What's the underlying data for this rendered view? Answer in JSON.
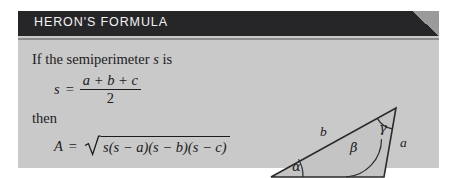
{
  "header": {
    "title": "HERON'S FORMULA",
    "bar_color": "#262628",
    "title_color": "#f2f2f2",
    "corner_color": "#9a9a9a"
  },
  "panel": {
    "background_color": "#c9c9c9",
    "rule_color": "#8d8d8d"
  },
  "body": {
    "intro_prefix": "If the semiperimeter ",
    "intro_variable": "s",
    "intro_suffix": " is",
    "then_label": "then"
  },
  "equation_s": {
    "lhs": "s",
    "equals": "=",
    "numerator": "a + b + c",
    "denominator": "2"
  },
  "equation_area": {
    "lhs": "A",
    "equals": "=",
    "radical_symbol": "√",
    "radicand": "s(s − a)(s − b)(s − c)"
  },
  "figure": {
    "caption_name": "labelled-triangle",
    "side_labels": {
      "a": "a",
      "b": "b",
      "c": "c"
    },
    "angle_labels": {
      "alpha": "α",
      "beta": "β",
      "gamma": "γ"
    },
    "fill_color": "#c4c4c4",
    "stroke_color": "#2b2b2b",
    "vertices": {
      "left": [
        21,
        89
      ],
      "apex": [
        146,
        20
      ],
      "right": [
        134,
        89
      ]
    }
  }
}
